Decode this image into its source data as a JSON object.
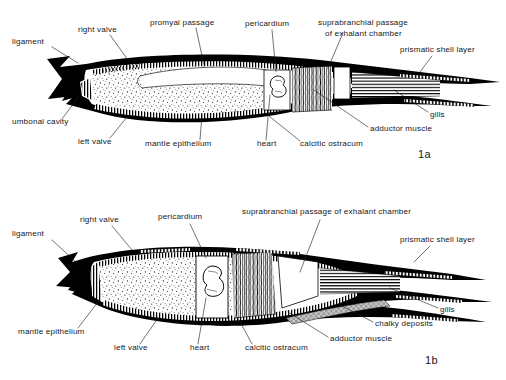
{
  "figure": {
    "background_color": "#ffffff",
    "ink_color": "#000000",
    "chalky_deposit_color": "#b9b9b9"
  },
  "panels": [
    {
      "id": "1a",
      "number_label": "1a",
      "labels": [
        {
          "key": "ligament",
          "text": "ligament",
          "x": 12,
          "y": 44,
          "anchor": "start",
          "leader": [
            [
              52,
              47
            ],
            [
              78,
              63
            ]
          ]
        },
        {
          "key": "right_valve",
          "text": "right valve",
          "x": 78,
          "y": 32,
          "anchor": "start",
          "leader": [
            [
              110,
              35
            ],
            [
              128,
              60
            ]
          ]
        },
        {
          "key": "promyal_passage",
          "text": "promyal passage",
          "x": 150,
          "y": 25,
          "anchor": "start",
          "leader": [
            [
              196,
              28
            ],
            [
              204,
              65
            ]
          ]
        },
        {
          "key": "pericardium",
          "text": "pericardium",
          "x": 245,
          "y": 26,
          "anchor": "start",
          "leader": [
            [
              272,
              30
            ],
            [
              276,
              72
            ]
          ]
        },
        {
          "key": "suprabranchial_1",
          "text": "suprabranchial passage",
          "x": 318,
          "y": 25,
          "anchor": "start",
          "leader": [
            [
              343,
              33
            ],
            [
              328,
              68
            ]
          ]
        },
        {
          "key": "suprabranchial_2",
          "text": "of exhalant chamber",
          "x": 325,
          "y": 36,
          "anchor": "start",
          "leader": null
        },
        {
          "key": "prismatic_layer",
          "text": "prismatic shell layer",
          "x": 400,
          "y": 52,
          "anchor": "start",
          "leader": [
            [
              432,
              56
            ],
            [
              420,
              72
            ]
          ]
        },
        {
          "key": "gills",
          "text": "gills",
          "x": 430,
          "y": 117,
          "anchor": "start",
          "leader": [
            [
              428,
              112
            ],
            [
              394,
              90
            ]
          ]
        },
        {
          "key": "adductor_muscle",
          "text": "adductor muscle",
          "x": 370,
          "y": 131,
          "anchor": "start",
          "leader": [
            [
              368,
              127
            ],
            [
              314,
              90
            ]
          ]
        },
        {
          "key": "calcitic_ostracum",
          "text": "calcitic ostracum",
          "x": 300,
          "y": 146,
          "anchor": "start",
          "leader": [
            [
              300,
              141
            ],
            [
              269,
              116
            ]
          ]
        },
        {
          "key": "heart",
          "text": "heart",
          "x": 257,
          "y": 146,
          "anchor": "start",
          "leader": [
            [
              266,
              140
            ],
            [
              270,
              95
            ]
          ]
        },
        {
          "key": "mantle_epithelium",
          "text": "mantle epithelium",
          "x": 145,
          "y": 146,
          "anchor": "start",
          "leader": [
            [
              200,
              140
            ],
            [
              202,
              115
            ]
          ]
        },
        {
          "key": "left_valve",
          "text": "left valve",
          "x": 78,
          "y": 144,
          "anchor": "start",
          "leader": [
            [
              110,
              138
            ],
            [
              127,
              117
            ]
          ]
        },
        {
          "key": "umbonal_cavity",
          "text": "umbonal cavity",
          "x": 12,
          "y": 124,
          "anchor": "start",
          "leader": [
            [
              62,
              119
            ],
            [
              80,
              95
            ]
          ]
        }
      ]
    },
    {
      "id": "1b",
      "number_label": "1b",
      "labels": [
        {
          "key": "ligament",
          "text": "ligament",
          "x": 12,
          "y": 236,
          "anchor": "start",
          "leader": [
            [
              52,
              240
            ],
            [
              76,
              262
            ]
          ]
        },
        {
          "key": "right_valve",
          "text": "right valve",
          "x": 80,
          "y": 222,
          "anchor": "start",
          "leader": [
            [
              112,
              226
            ],
            [
              132,
              250
            ]
          ]
        },
        {
          "key": "pericardium",
          "text": "pericardium",
          "x": 158,
          "y": 219,
          "anchor": "start",
          "leader": [
            [
              190,
              224
            ],
            [
              206,
              258
            ]
          ]
        },
        {
          "key": "suprabranchial",
          "text": "suprabranchial passage of exhalant chamber",
          "x": 242,
          "y": 214,
          "anchor": "start",
          "leader": [
            [
              320,
              220
            ],
            [
              300,
              272
            ]
          ]
        },
        {
          "key": "prismatic_layer",
          "text": "prismatic shell layer",
          "x": 400,
          "y": 242,
          "anchor": "start",
          "leader": [
            [
              430,
              246
            ],
            [
              414,
              262
            ]
          ]
        },
        {
          "key": "gills",
          "text": "gills",
          "x": 440,
          "y": 312,
          "anchor": "start",
          "leader": [
            [
              438,
              308
            ],
            [
              390,
              288
            ]
          ]
        },
        {
          "key": "chalky_deposits",
          "text": "chalky deposits",
          "x": 375,
          "y": 326,
          "anchor": "start",
          "leader": [
            [
              373,
              322
            ],
            [
              340,
              305
            ]
          ]
        },
        {
          "key": "adductor_muscle",
          "text": "adductor muscle",
          "x": 330,
          "y": 341,
          "anchor": "start",
          "leader": [
            [
              328,
              337
            ],
            [
              288,
              312
            ]
          ]
        },
        {
          "key": "calcitic_ostracum",
          "text": "calcitic ostracum",
          "x": 245,
          "y": 350,
          "anchor": "start",
          "leader": [
            [
              252,
              344
            ],
            [
              238,
              318
            ]
          ]
        },
        {
          "key": "heart",
          "text": "heart",
          "x": 190,
          "y": 350,
          "anchor": "start",
          "leader": [
            [
              198,
              344
            ],
            [
              206,
              298
            ]
          ]
        },
        {
          "key": "left_valve",
          "text": "left valve",
          "x": 114,
          "y": 350,
          "anchor": "start",
          "leader": [
            [
              140,
              344
            ],
            [
              158,
              318
            ]
          ]
        },
        {
          "key": "mantle_epithelium",
          "text": "mantle epithelium",
          "x": 18,
          "y": 334,
          "anchor": "start",
          "leader": [
            [
              78,
              328
            ],
            [
              98,
              302
            ]
          ]
        }
      ]
    }
  ]
}
